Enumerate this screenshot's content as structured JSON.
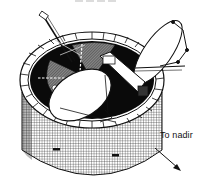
{
  "figure": {
    "parts": [
      "cylindrical solar-cell body",
      "segmented upper rim",
      "internal equipment deck",
      "main dish antenna",
      "secondary dish antenna",
      "instrument mast"
    ],
    "colors": {
      "line": "#111111",
      "fill": "#ffffff",
      "deck": "#0a0a0a",
      "hatch": "#555555"
    }
  },
  "annotations": {
    "nadir_label": "To nadir",
    "nadir_arrow": "arrow-down-right-icon"
  }
}
